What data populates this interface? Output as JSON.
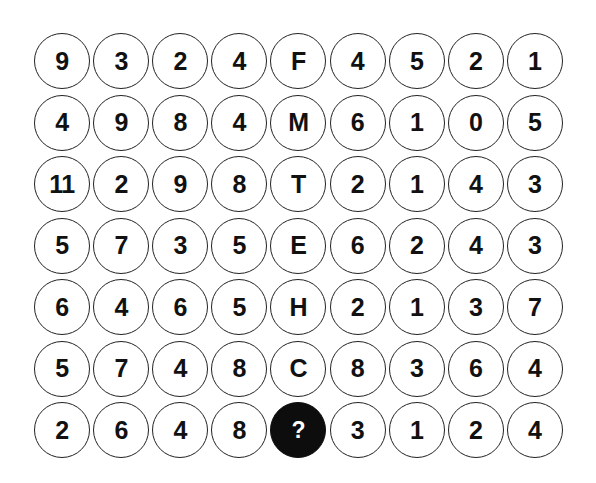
{
  "puzzle": {
    "rows": [
      [
        "9",
        "3",
        "2",
        "4",
        "F",
        "4",
        "5",
        "2",
        "1"
      ],
      [
        "4",
        "9",
        "8",
        "4",
        "M",
        "6",
        "1",
        "0",
        "5"
      ],
      [
        "11",
        "2",
        "9",
        "8",
        "T",
        "2",
        "1",
        "4",
        "3"
      ],
      [
        "5",
        "7",
        "3",
        "5",
        "E",
        "6",
        "2",
        "4",
        "3"
      ],
      [
        "6",
        "4",
        "6",
        "5",
        "H",
        "2",
        "1",
        "3",
        "7"
      ],
      [
        "5",
        "7",
        "4",
        "8",
        "C",
        "8",
        "3",
        "6",
        "4"
      ],
      [
        "2",
        "6",
        "4",
        "8",
        "?",
        "3",
        "1",
        "2",
        "4"
      ]
    ],
    "unknown_cell": {
      "row": 6,
      "col": 4,
      "label": "?"
    },
    "colors": {
      "circle_border": "#222222",
      "text": "#111111",
      "unknown_fill": "#0d0d0d",
      "unknown_text": "#ffffff",
      "background": "#ffffff"
    }
  }
}
